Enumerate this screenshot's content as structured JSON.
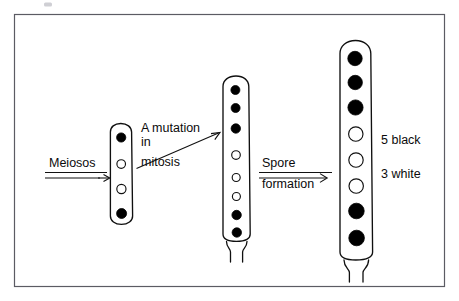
{
  "figure": {
    "background_color": "#ffffff",
    "frame_color": "#5b5b63",
    "ink_color": "#101010"
  },
  "steps": [
    {
      "id": "meiosis",
      "label_lines": [
        "Meiosos"
      ],
      "arrow": "horizontal-right"
    },
    {
      "id": "mutation",
      "label_lines": [
        "A mutation",
        "in",
        "mitosis"
      ],
      "arrow": "diagonal-up-right"
    },
    {
      "id": "spore-formation",
      "label_lines": [
        "Spore",
        "formation"
      ],
      "arrow": "horizontal-right"
    }
  ],
  "asci": [
    {
      "id": "ascus-1",
      "stage": "after-meiosis",
      "spore_count": 4,
      "spores": [
        "black",
        "white",
        "white",
        "black"
      ],
      "black_count": 2,
      "white_count": 2
    },
    {
      "id": "ascus-2",
      "stage": "after-mitosis-with-mutation",
      "spore_count": 8,
      "spores": [
        "black",
        "black",
        "black",
        "white",
        "white",
        "white",
        "black",
        "black"
      ],
      "black_count": 5,
      "white_count": 3
    },
    {
      "id": "ascus-3",
      "stage": "mature-spores",
      "spore_count": 8,
      "spores": [
        "black",
        "black",
        "black",
        "white",
        "white",
        "white",
        "black",
        "black"
      ],
      "black_count": 5,
      "white_count": 3
    }
  ],
  "result": {
    "black_line": "5 black",
    "white_line": "3 white"
  },
  "colors": {
    "spore_black": "#000000",
    "spore_white": "#ffffff",
    "outline": "#101010"
  }
}
